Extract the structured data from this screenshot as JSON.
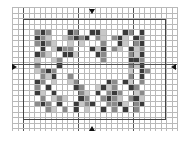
{
  "pattern": {
    "cols": 30,
    "rows": 22,
    "cell_px": 5.5,
    "origin": {
      "x": 12,
      "y": 7
    },
    "major_every": 10,
    "major_cols": [
      2,
      12,
      22
    ],
    "major_rows": [
      10.4
    ],
    "frame": {
      "col0": 2,
      "row0": 2.2,
      "col1": 28,
      "row1": 20.6
    },
    "shades": {
      "0": "#ffffff",
      "1": "#c8c8c8",
      "2": "#8a8a8a",
      "3": "#3a3a3a"
    },
    "filled": [
      [
        4,
        4,
        2
      ],
      [
        4,
        5,
        3
      ],
      [
        4,
        6,
        2
      ],
      [
        4,
        10,
        3
      ],
      [
        4,
        11,
        2
      ],
      [
        4,
        14,
        3
      ],
      [
        4,
        15,
        3
      ],
      [
        4,
        16,
        1
      ],
      [
        4,
        20,
        3
      ],
      [
        4,
        21,
        2
      ],
      [
        4,
        23,
        3
      ],
      [
        5,
        4,
        3
      ],
      [
        5,
        5,
        2
      ],
      [
        5,
        6,
        1
      ],
      [
        5,
        9,
        1
      ],
      [
        5,
        10,
        2
      ],
      [
        5,
        11,
        3
      ],
      [
        5,
        12,
        2
      ],
      [
        5,
        13,
        3
      ],
      [
        5,
        15,
        2
      ],
      [
        5,
        16,
        1
      ],
      [
        5,
        18,
        2
      ],
      [
        5,
        19,
        3
      ],
      [
        5,
        20,
        1
      ],
      [
        5,
        22,
        3
      ],
      [
        5,
        23,
        2
      ],
      [
        6,
        4,
        2
      ],
      [
        6,
        5,
        3
      ],
      [
        6,
        6,
        2
      ],
      [
        6,
        7,
        1
      ],
      [
        6,
        10,
        1
      ],
      [
        6,
        12,
        1
      ],
      [
        6,
        16,
        2
      ],
      [
        6,
        19,
        3
      ],
      [
        6,
        20,
        1
      ],
      [
        6,
        22,
        2
      ],
      [
        6,
        23,
        3
      ],
      [
        7,
        5,
        3
      ],
      [
        7,
        7,
        1
      ],
      [
        7,
        8,
        3
      ],
      [
        7,
        9,
        2
      ],
      [
        7,
        10,
        2
      ],
      [
        7,
        14,
        3
      ],
      [
        7,
        15,
        1
      ],
      [
        7,
        16,
        3
      ],
      [
        7,
        18,
        2
      ],
      [
        7,
        19,
        1
      ],
      [
        7,
        21,
        3
      ],
      [
        7,
        22,
        1
      ],
      [
        7,
        23,
        2
      ],
      [
        8,
        4,
        3
      ],
      [
        8,
        5,
        2
      ],
      [
        8,
        6,
        1
      ],
      [
        8,
        9,
        3
      ],
      [
        8,
        10,
        3
      ],
      [
        8,
        11,
        1
      ],
      [
        8,
        15,
        3
      ],
      [
        8,
        16,
        2
      ],
      [
        8,
        21,
        2
      ],
      [
        8,
        22,
        1
      ],
      [
        8,
        23,
        3
      ],
      [
        9,
        4,
        1
      ],
      [
        9,
        7,
        1
      ],
      [
        9,
        8,
        2
      ],
      [
        9,
        16,
        2
      ],
      [
        9,
        21,
        3
      ],
      [
        9,
        22,
        3
      ],
      [
        9,
        23,
        2
      ],
      [
        10,
        4,
        2
      ],
      [
        10,
        8,
        3
      ],
      [
        10,
        21,
        2
      ],
      [
        10,
        22,
        1
      ],
      [
        10,
        23,
        3
      ],
      [
        11,
        4,
        1
      ],
      [
        11,
        5,
        2
      ],
      [
        11,
        6,
        3
      ],
      [
        11,
        7,
        2
      ],
      [
        11,
        21,
        1
      ],
      [
        11,
        23,
        3
      ],
      [
        11,
        24,
        2
      ],
      [
        12,
        5,
        2
      ],
      [
        12,
        6,
        1
      ],
      [
        12,
        7,
        3
      ],
      [
        12,
        10,
        2
      ],
      [
        12,
        21,
        2
      ],
      [
        12,
        23,
        3
      ],
      [
        13,
        4,
        3
      ],
      [
        13,
        5,
        2
      ],
      [
        13,
        7,
        1
      ],
      [
        13,
        10,
        1
      ],
      [
        13,
        11,
        2
      ],
      [
        13,
        17,
        3
      ],
      [
        13,
        18,
        2
      ],
      [
        13,
        20,
        3
      ],
      [
        13,
        21,
        1
      ],
      [
        13,
        23,
        2
      ],
      [
        14,
        4,
        2
      ],
      [
        14,
        6,
        3
      ],
      [
        14,
        11,
        3
      ],
      [
        14,
        12,
        2
      ],
      [
        14,
        15,
        1
      ],
      [
        14,
        16,
        3
      ],
      [
        14,
        17,
        1
      ],
      [
        14,
        18,
        2
      ],
      [
        14,
        21,
        3
      ],
      [
        14,
        22,
        2
      ],
      [
        15,
        4,
        3
      ],
      [
        15,
        5,
        1
      ],
      [
        15,
        7,
        3
      ],
      [
        15,
        12,
        2
      ],
      [
        15,
        13,
        1
      ],
      [
        15,
        15,
        3
      ],
      [
        15,
        17,
        2
      ],
      [
        15,
        18,
        3
      ],
      [
        15,
        19,
        2
      ],
      [
        15,
        22,
        1
      ],
      [
        15,
        23,
        2
      ],
      [
        16,
        5,
        2
      ],
      [
        16,
        7,
        1
      ],
      [
        16,
        8,
        2
      ],
      [
        16,
        9,
        1
      ],
      [
        16,
        12,
        3
      ],
      [
        16,
        13,
        2
      ],
      [
        16,
        16,
        2
      ],
      [
        16,
        17,
        3
      ],
      [
        16,
        18,
        2
      ],
      [
        16,
        19,
        1
      ],
      [
        16,
        21,
        2
      ],
      [
        16,
        22,
        3
      ],
      [
        16,
        23,
        1
      ],
      [
        17,
        4,
        2
      ],
      [
        17,
        5,
        3
      ],
      [
        17,
        6,
        2
      ],
      [
        17,
        8,
        3
      ],
      [
        17,
        11,
        3
      ],
      [
        17,
        12,
        1
      ],
      [
        17,
        13,
        2
      ],
      [
        17,
        14,
        3
      ],
      [
        17,
        17,
        2
      ],
      [
        17,
        18,
        2
      ],
      [
        17,
        19,
        3
      ],
      [
        17,
        20,
        1
      ],
      [
        17,
        22,
        2
      ],
      [
        17,
        23,
        3
      ],
      [
        18,
        6,
        2
      ],
      [
        18,
        7,
        1
      ],
      [
        18,
        9,
        2
      ],
      [
        18,
        11,
        3
      ],
      [
        18,
        13,
        1
      ],
      [
        18,
        16,
        3
      ],
      [
        18,
        18,
        2
      ],
      [
        18,
        20,
        3
      ],
      [
        18,
        22,
        2
      ]
    ]
  },
  "center_markers": [
    {
      "name": "top-center-arrow",
      "dir": "down",
      "x": 92,
      "y": 9
    },
    {
      "name": "bottom-center-arrow",
      "dir": "up",
      "x": 92,
      "y": 126
    },
    {
      "name": "left-center-arrow",
      "dir": "right",
      "x": 12,
      "y": 67
    },
    {
      "name": "right-center-arrow",
      "dir": "left",
      "x": 171,
      "y": 67
    }
  ]
}
